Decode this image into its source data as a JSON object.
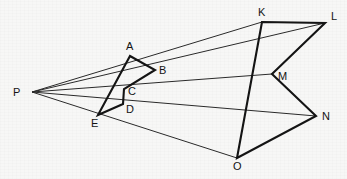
{
  "figure": {
    "title": "",
    "background_color": "#f7f7f6",
    "ink_color": "#1a1a1a",
    "thick_stroke": 2.1,
    "thin_stroke": 1.0,
    "width": 347,
    "height": 179
  },
  "labels": {
    "P": "P",
    "A": "A",
    "B": "B",
    "C": "C",
    "D": "D",
    "E": "E",
    "K": "K",
    "L": "L",
    "M": "M",
    "N": "N",
    "O": "O"
  },
  "points": {
    "P": {
      "x": 32,
      "y": 92,
      "label_x": 13,
      "label_y": 96
    },
    "A": {
      "x": 130,
      "y": 56,
      "label_x": 126,
      "label_y": 50
    },
    "B": {
      "x": 155,
      "y": 70,
      "label_x": 159,
      "label_y": 74
    },
    "C": {
      "x": 124,
      "y": 89,
      "label_x": 128,
      "label_y": 95
    },
    "D": {
      "x": 123,
      "y": 104,
      "label_x": 126,
      "label_y": 113
    },
    "E": {
      "x": 98,
      "y": 115,
      "label_x": 91,
      "label_y": 127
    },
    "K": {
      "x": 262,
      "y": 22,
      "label_x": 258,
      "label_y": 16
    },
    "L": {
      "x": 325,
      "y": 23,
      "label_x": 331,
      "label_y": 20
    },
    "M": {
      "x": 272,
      "y": 74,
      "label_x": 278,
      "label_y": 80
    },
    "N": {
      "x": 316,
      "y": 116,
      "label_x": 322,
      "label_y": 120
    },
    "O": {
      "x": 237,
      "y": 158,
      "label_x": 233,
      "label_y": 170
    }
  },
  "small_polygon": {
    "name": "ABCDE",
    "vertex_order": [
      "A",
      "B",
      "C",
      "D",
      "E"
    ],
    "stroke_weight": "thick"
  },
  "large_polygon": {
    "name": "KLMNO",
    "vertex_order": [
      "K",
      "L",
      "M",
      "N",
      "O"
    ],
    "stroke_weight": "thick"
  },
  "projection_rays": [
    {
      "name": "ray-P-A-K",
      "from": "P",
      "through": "A",
      "to": "K"
    },
    {
      "name": "ray-P-B-L",
      "from": "P",
      "through": "B",
      "to": "L"
    },
    {
      "name": "ray-P-C-M",
      "from": "P",
      "through": "C",
      "to": "M"
    },
    {
      "name": "ray-P-D-N",
      "from": "P",
      "through": "D",
      "to": "N"
    },
    {
      "name": "ray-P-E-O",
      "from": "P",
      "through": "E",
      "to": "O"
    }
  ]
}
